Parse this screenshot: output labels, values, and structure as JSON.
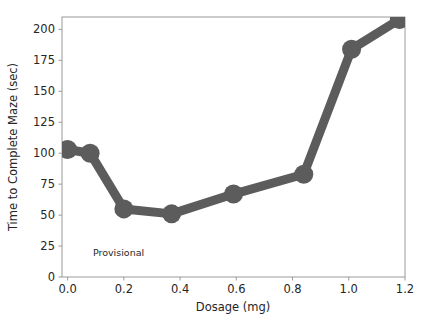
{
  "chart_data": {
    "type": "line",
    "title": "",
    "xlabel": "Dosage (mg)",
    "ylabel": "Time to Complete Maze (sec)",
    "xlim": [
      -0.02,
      1.2
    ],
    "ylim": [
      0,
      210
    ],
    "xticks": [
      "0.0",
      "0.2",
      "0.4",
      "0.6",
      "0.8",
      "1.0",
      "1.2"
    ],
    "xtick_values": [
      0.0,
      0.2,
      0.4,
      0.6,
      0.8,
      1.0,
      1.2
    ],
    "yticks": [
      "0",
      "25",
      "50",
      "75",
      "100",
      "125",
      "150",
      "175",
      "200"
    ],
    "ytick_values": [
      0,
      25,
      50,
      75,
      100,
      125,
      150,
      175,
      200
    ],
    "grid": false,
    "legend": false,
    "series": [
      {
        "name": "Time to Complete Maze",
        "color": "#5c5c5c",
        "marker": "circle",
        "marker_size": 19,
        "line_width": 9,
        "x": [
          0.0,
          0.08,
          0.2,
          0.37,
          0.59,
          0.84,
          1.01,
          1.18
        ],
        "y": [
          103,
          100,
          55,
          51,
          67,
          83,
          184,
          208
        ]
      }
    ],
    "annotations": [
      {
        "text": "Provisional",
        "x": 0.09,
        "y": 17
      }
    ]
  },
  "colors": {
    "series": "#5c5c5c",
    "background": "#ffffff",
    "axis": "#9a9a9a",
    "text": "#262626"
  }
}
